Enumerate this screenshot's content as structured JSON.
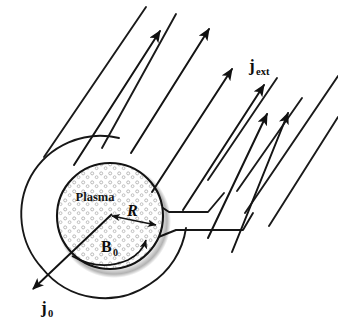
{
  "figure": {
    "type": "schematic-diagram",
    "width": 338,
    "height": 329,
    "background_color": "#ffffff",
    "stroke_color": "#141414"
  },
  "labels": {
    "plasma": {
      "text": "Plasma",
      "x": 95,
      "y": 200,
      "font_size": 12,
      "style": "bold-serif"
    },
    "radius": {
      "text": "R",
      "x": 127,
      "y": 215,
      "font_size": 15,
      "style": "bold-italic-serif"
    },
    "b_field": {
      "base": "B",
      "sub": "0",
      "x": 108,
      "y": 250,
      "font_size": 15,
      "style": "bold-serif"
    },
    "j_ext": {
      "base": "j",
      "sub": "ext",
      "x": 252,
      "y": 70,
      "font_size": 15,
      "style": "bold-serif"
    },
    "j_zero": {
      "base": "j",
      "sub": "0",
      "x": 43,
      "y": 313,
      "font_size": 15,
      "style": "bold-serif"
    }
  },
  "geometry": {
    "outer_circle": {
      "name": "outer-shell-circle",
      "cx": 110,
      "cy": 218,
      "r": 80
    },
    "plasma_circle": {
      "name": "plasma-core-circle",
      "cx": 110,
      "cy": 216,
      "r": 54,
      "fill": "#ffffff",
      "stipple_color": "#a8a8a8",
      "stipple_count": 150,
      "shadow": true
    },
    "radius_arrow": {
      "name": "radius-double-arrow",
      "x1": 110,
      "y1": 216,
      "x2": 159,
      "y2": 226
    },
    "b_field_arc": {
      "name": "magnetic-field-arc",
      "description": "curved arrow inside plasma indicating B0 direction"
    },
    "j0_arrow": {
      "name": "surface-current-arrow",
      "x1": 110,
      "y1": 216,
      "x2": 32,
      "y2": 290
    }
  },
  "current_arrows": {
    "name": "external-current-arrows",
    "angle_deg": -41,
    "count": 6,
    "items": [
      {
        "x1": 75,
        "y1": 164,
        "x2": 160,
        "y2": 31,
        "head": true
      },
      {
        "x1": 131,
        "y1": 152,
        "x2": 208,
        "y2": 29,
        "head": true
      },
      {
        "x1": 152,
        "y1": 192,
        "x2": 231,
        "y2": 69,
        "head": true
      },
      {
        "x1": 183,
        "y1": 209,
        "x2": 263,
        "y2": 85,
        "head": true
      },
      {
        "x1": 209,
        "y1": 237,
        "x2": 266,
        "y2": 115,
        "head": true
      },
      {
        "x1": 229,
        "y1": 252,
        "x2": 287,
        "y2": 113,
        "head": true
      }
    ]
  },
  "boundary_lines": {
    "name": "current-sheet-boundary-lines",
    "items": [
      {
        "x1": 44,
        "y1": 157,
        "x2": 146,
        "y2": 7
      },
      {
        "x1": 102,
        "y1": 148,
        "x2": 176,
        "y2": 14
      },
      {
        "x1": 150,
        "y1": 231,
        "x2": 170,
        "y2": 211
      },
      {
        "x1": 277,
        "y1": 77,
        "x2": 207,
        "y2": 180
      },
      {
        "x1": 301,
        "y1": 97,
        "x2": 236,
        "y2": 190
      },
      {
        "x1": 338,
        "y1": 77,
        "x2": 244,
        "y2": 214
      },
      {
        "x1": 338,
        "y1": 118,
        "x2": 268,
        "y2": 226
      }
    ]
  }
}
